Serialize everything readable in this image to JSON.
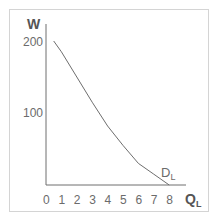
{
  "chart_data": {
    "type": "line",
    "title": "",
    "xlabel": "Q",
    "xlabel_sub": "L",
    "ylabel": "W",
    "xlim": [
      0,
      8
    ],
    "ylim": [
      0,
      220
    ],
    "x_ticks": [
      "0",
      "1",
      "2",
      "3",
      "4",
      "5",
      "6",
      "7",
      "8"
    ],
    "y_ticks": [
      "100",
      "200"
    ],
    "grid": false,
    "series": [
      {
        "name": "D",
        "name_sub": "L",
        "x": [
          0.5,
          1,
          2,
          3,
          4,
          5,
          6,
          7,
          8
        ],
        "values": [
          200,
          185,
          150,
          115,
          82,
          55,
          30,
          15,
          0
        ]
      }
    ],
    "annotations": [
      {
        "text": "D",
        "sub": "L",
        "x": 7.6,
        "y": 18
      }
    ]
  },
  "colors": {
    "line": "#6e6e6e",
    "axis": "#6e6e6e",
    "frame": "#d4d4d4",
    "text": "#6b6b6b"
  }
}
